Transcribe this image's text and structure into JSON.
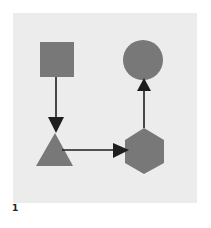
{
  "figure": {
    "label": "1",
    "background_color": "#ececec",
    "shape_color": "#787878",
    "arrow_color": "#1e1e1e"
  },
  "nodes": [
    {
      "id": "square",
      "shape": "square"
    },
    {
      "id": "triangle",
      "shape": "triangle"
    },
    {
      "id": "hexagon",
      "shape": "hexagon"
    },
    {
      "id": "circle",
      "shape": "circle"
    }
  ],
  "edges": [
    {
      "from": "square",
      "to": "triangle",
      "direction": "down"
    },
    {
      "from": "triangle",
      "to": "hexagon",
      "direction": "right"
    },
    {
      "from": "hexagon",
      "to": "circle",
      "direction": "up"
    }
  ]
}
